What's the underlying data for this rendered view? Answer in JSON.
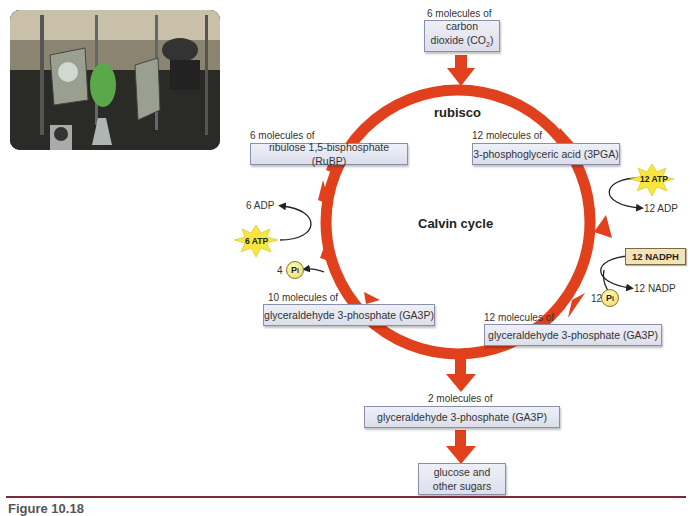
{
  "photo": {
    "description": "laboratory apparatus with green algae flask"
  },
  "diagram": {
    "title": "Calvin cycle",
    "enzyme": "rubisco",
    "inputs": {
      "co2_count": "6 molecules of",
      "co2_name_line1": "carbon",
      "co2_name_line2": "dioxide (CO",
      "co2_sub": "2",
      "co2_close": ")"
    },
    "nodes": {
      "rubp_count": "6 molecules of",
      "rubp_name": "ribulose 1,5-bisphosphate (RuBP)",
      "pga_count": "12 molecules of",
      "pga_name": "3-phosphoglyceric acid (3PGA)",
      "ga3p12_count": "12 molecules of",
      "ga3p12_name": "glyceraldehyde 3-phosphate (GA3P)",
      "ga3p10_count": "10 molecules of",
      "ga3p10_name": "glyceraldehyde 3-phosphate (GA3P)",
      "ga3p2_count": "2 molecules of",
      "ga3p2_name": "glyceraldehyde 3-phosphate (GA3P)",
      "sugar_line1": "glucose and",
      "sugar_line2": "other sugars"
    },
    "energy": {
      "atp12": "12 ATP",
      "adp12": "12 ADP",
      "nadph12": "12 NADPH",
      "nadp12": "12 NADP",
      "pi12_count": "12",
      "atp6": "6 ATP",
      "adp6": "6 ADP",
      "pi4_count": "4",
      "pi_symbol": "P",
      "pi_sub": "i"
    },
    "colors": {
      "arrow": "#e0401c",
      "box": "#e4e6f0",
      "star": "#f5e640"
    }
  },
  "caption": {
    "text": "Figure 10.18"
  }
}
